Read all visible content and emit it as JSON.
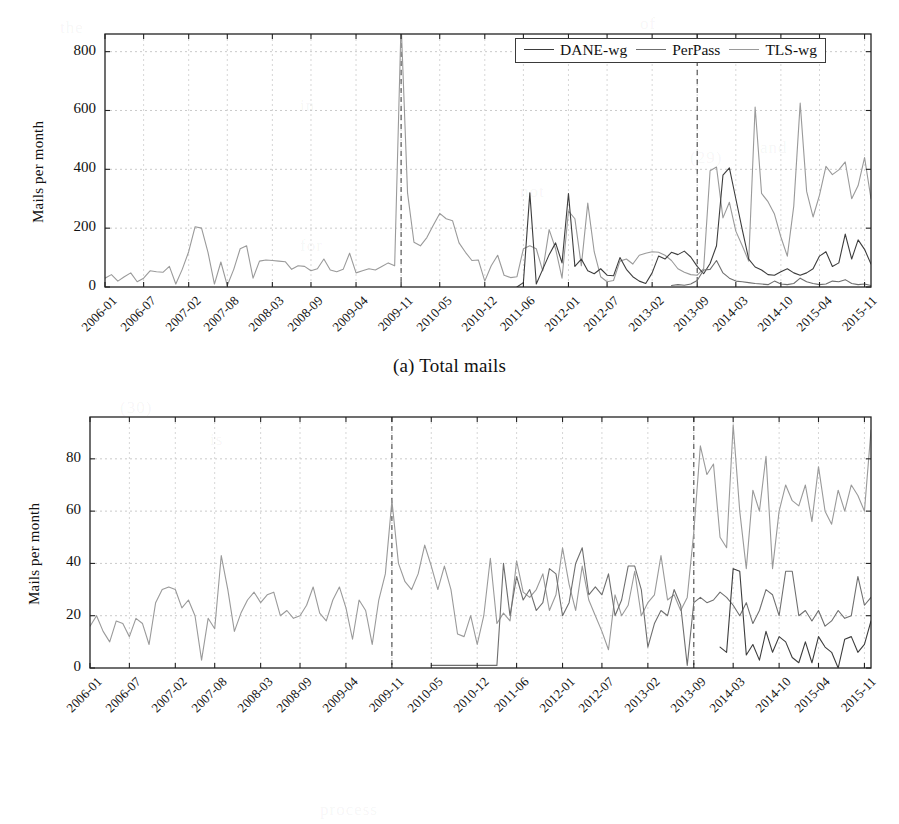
{
  "figure": {
    "panels": [
      {
        "id": "a",
        "caption": "(a) Total mails",
        "ylabel": "Mails per month",
        "yticks": [
          "0",
          "200",
          "400",
          "600",
          "800"
        ]
      },
      {
        "id": "b",
        "caption": "(b) Mails with unique senders",
        "ylabel": "Mails per month",
        "yticks": [
          "0",
          "20",
          "40",
          "60",
          "80"
        ]
      }
    ],
    "legend": {
      "items": [
        {
          "label": "DANE-wg",
          "color": "#3d3d3d"
        },
        {
          "label": "PerPass",
          "color": "#6f6f6f"
        },
        {
          "label": "TLS-wg",
          "color": "#9a9a9a"
        }
      ]
    },
    "xticks": [
      "2006-01",
      "2006-07",
      "2007-02",
      "2007-08",
      "2008-03",
      "2008-09",
      "2009-04",
      "2009-11",
      "2010-05",
      "2010-12",
      "2011-06",
      "2012-01",
      "2012-07",
      "2013-02",
      "2013-09",
      "2014-03",
      "2014-10",
      "2015-04",
      "2015-11"
    ]
  },
  "chart_data": [
    {
      "type": "line",
      "panel": "a",
      "title": "(a) Total mails",
      "xlabel": "",
      "ylabel": "Mails per month",
      "ylim": [
        0,
        860
      ],
      "grid": true,
      "legend_position": "top-right",
      "xtick_labels": [
        "2006-01",
        "2006-07",
        "2007-02",
        "2007-08",
        "2008-03",
        "2008-09",
        "2009-04",
        "2009-11",
        "2010-05",
        "2010-12",
        "2011-06",
        "2012-01",
        "2012-07",
        "2013-02",
        "2013-09",
        "2014-03",
        "2014-10",
        "2015-04",
        "2015-11"
      ],
      "xtick_indices": [
        0,
        6,
        13,
        19,
        26,
        32,
        39,
        46,
        52,
        59,
        65,
        72,
        78,
        85,
        92,
        98,
        105,
        111,
        118
      ],
      "x_start": "2006-01",
      "x_count": 120,
      "annotations": [
        {
          "type": "vline",
          "x_index": 46,
          "label": "2009-11",
          "style": "dashed"
        },
        {
          "type": "vline",
          "x_index": 92,
          "label": "2013-09",
          "style": "dashed"
        }
      ],
      "series": [
        {
          "name": "TLS-wg",
          "color": "#9a9a9a",
          "start_index": 0,
          "values": [
            30,
            42,
            20,
            35,
            48,
            18,
            30,
            55,
            52,
            50,
            70,
            10,
            60,
            120,
            205,
            200,
            118,
            10,
            85,
            5,
            60,
            130,
            140,
            30,
            88,
            92,
            90,
            88,
            86,
            60,
            72,
            70,
            55,
            62,
            95,
            58,
            52,
            60,
            115,
            48,
            55,
            62,
            58,
            70,
            82,
            72,
            900,
            320,
            152,
            140,
            168,
            210,
            250,
            232,
            225,
            150,
            118,
            90,
            92,
            20,
            72,
            108,
            40,
            32,
            35,
            130,
            140,
            130,
            55,
            195,
            130,
            30,
            258,
            232,
            72,
            285,
            120,
            35,
            18,
            22,
            88,
            95,
            78,
            108,
            115,
            120,
            118,
            108,
            90,
            62,
            50,
            42,
            40,
            62,
            395,
            408,
            235,
            288,
            190,
            140,
            88,
            612,
            318,
            290,
            248,
            170,
            105,
            275,
            625,
            325,
            238,
            312,
            410,
            382,
            398,
            425,
            300,
            345,
            440,
            300,
            275,
            380,
            225,
            268,
            195,
            230,
            225,
            520
          ]
        },
        {
          "name": "DANE-wg",
          "color": "#3d3d3d",
          "start_index": 64,
          "values": [
            0,
            15,
            320,
            10,
            60,
            110,
            150,
            82,
            318,
            70,
            95,
            55,
            45,
            62,
            40,
            38,
            100,
            60,
            35,
            20,
            12,
            48,
            105,
            95,
            118,
            110,
            122,
            102,
            70,
            45,
            80,
            140,
            380,
            405,
            300,
            195,
            95,
            68,
            58,
            42,
            40,
            52,
            62,
            48,
            40,
            48,
            62,
            105,
            120,
            70,
            82,
            180,
            95,
            160,
            128,
            78,
            58,
            35,
            28,
            18,
            12,
            10,
            8,
            5,
            18,
            40,
            10,
            45
          ]
        },
        {
          "name": "PerPass",
          "color": "#6f6f6f",
          "start_index": 88,
          "values": [
            5,
            8,
            6,
            10,
            22,
            58,
            60,
            90,
            48,
            30,
            20,
            18,
            15,
            12,
            10,
            8,
            20,
            10,
            8,
            12,
            30,
            18,
            12,
            8,
            10,
            20,
            18,
            25,
            12,
            8,
            10,
            5
          ]
        }
      ]
    },
    {
      "type": "line",
      "panel": "b",
      "title": "(b) Mails with unique senders",
      "xlabel": "",
      "ylabel": "Mails per month",
      "ylim": [
        0,
        96
      ],
      "grid": true,
      "legend_position": "none",
      "xtick_labels": [
        "2006-01",
        "2006-07",
        "2007-02",
        "2007-08",
        "2008-03",
        "2008-09",
        "2009-04",
        "2009-11",
        "2010-05",
        "2010-12",
        "2011-06",
        "2012-01",
        "2012-07",
        "2013-02",
        "2013-09",
        "2014-03",
        "2014-10",
        "2015-04",
        "2015-11"
      ],
      "xtick_indices": [
        0,
        6,
        13,
        19,
        26,
        32,
        39,
        46,
        52,
        59,
        65,
        72,
        78,
        85,
        92,
        98,
        105,
        111,
        118
      ],
      "x_start": "2006-01",
      "x_count": 120,
      "annotations": [
        {
          "type": "vline",
          "x_index": 46,
          "label": "2009-11",
          "style": "dashed"
        },
        {
          "type": "vline",
          "x_index": 92,
          "label": "2013-09",
          "style": "dashed"
        }
      ],
      "series": [
        {
          "name": "TLS-wg",
          "color": "#9a9a9a",
          "start_index": 0,
          "values": [
            16,
            20,
            14,
            10,
            18,
            17,
            12,
            19,
            17,
            9,
            25,
            30,
            31,
            30,
            23,
            26,
            20,
            3,
            19,
            15,
            43,
            30,
            14,
            21,
            26,
            29,
            25,
            28,
            29,
            20,
            22,
            19,
            20,
            24,
            31,
            21,
            18,
            26,
            31,
            23,
            11,
            26,
            22,
            9,
            26,
            36,
            64,
            40,
            33,
            30,
            36,
            47,
            39,
            30,
            39,
            30,
            13,
            12,
            20,
            9,
            20,
            42,
            17,
            21,
            18,
            41,
            29,
            27,
            30,
            36,
            22,
            28,
            46,
            32,
            22,
            39,
            26,
            20,
            14,
            7,
            28,
            20,
            24,
            37,
            20,
            25,
            28,
            43,
            26,
            28,
            22,
            27,
            52,
            85,
            74,
            78,
            50,
            46,
            93,
            60,
            38,
            68,
            60,
            81,
            38,
            60,
            70,
            64,
            62,
            70,
            56,
            77,
            60,
            55,
            68,
            60,
            70,
            66,
            60,
            91
          ]
        },
        {
          "name": "PerPass",
          "color": "#6f6f6f",
          "start_index": 52,
          "values": [
            1,
            1,
            1,
            1,
            1,
            1,
            1,
            1,
            1,
            1,
            1,
            40,
            20,
            35,
            26,
            30,
            22,
            25,
            38,
            36,
            20,
            25,
            40,
            46,
            28,
            31,
            28,
            36,
            20,
            26,
            39,
            39,
            30,
            8,
            17,
            22,
            20,
            30,
            24,
            1,
            25,
            27,
            25,
            26,
            29,
            27,
            24,
            20,
            25,
            17,
            22,
            30,
            28,
            20,
            37,
            37,
            20,
            22,
            18,
            22,
            16,
            18,
            22,
            19,
            20,
            35,
            24,
            27,
            30,
            42,
            20,
            25,
            10,
            12,
            8,
            20
          ]
        },
        {
          "name": "DANE-wg",
          "color": "#3d3d3d",
          "start_index": 96,
          "values": [
            8,
            6,
            38,
            37,
            5,
            9,
            3,
            14,
            6,
            12,
            10,
            4,
            2,
            10,
            2,
            12,
            8,
            6,
            0,
            11,
            12,
            6,
            9,
            18
          ]
        }
      ]
    }
  ],
  "background_bleed": [
    {
      "text": "the",
      "x": 60,
      "y": 18
    },
    {
      "text": "of",
      "x": 640,
      "y": 14
    },
    {
      "text": "in",
      "x": 300,
      "y": 96
    },
    {
      "text": "and",
      "x": 760,
      "y": 138
    },
    {
      "text": "(29)",
      "x": 690,
      "y": 148
    },
    {
      "text": "not",
      "x": 520,
      "y": 182
    },
    {
      "text": "for",
      "x": 300,
      "y": 236
    },
    {
      "text": "(30)",
      "x": 120,
      "y": 398
    },
    {
      "text": "is",
      "x": 210,
      "y": 430
    },
    {
      "text": "process",
      "x": 320,
      "y": 800
    }
  ]
}
